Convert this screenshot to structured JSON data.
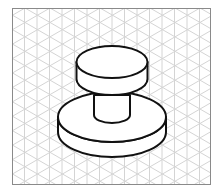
{
  "diagram": {
    "type": "isometric-drawing",
    "frame": {
      "x": 12,
      "y": 8,
      "width": 199,
      "height": 177,
      "stroke": "#8a8a8a"
    },
    "grid": {
      "color": "#d4d4d4",
      "vertical_spacing": 12.5
    },
    "line_color": "#111111",
    "parts": [
      {
        "name": "top-cap",
        "cx": 112,
        "cy": 62,
        "rx": 35.5,
        "ry": 16,
        "height": 17
      },
      {
        "name": "stem",
        "cx": 112,
        "cy": 95,
        "rx": 18,
        "ry": 8,
        "height": 20
      },
      {
        "name": "base-disk",
        "cx": 112,
        "cy": 117,
        "rx": 54,
        "ry": 25,
        "height": 15
      }
    ]
  }
}
